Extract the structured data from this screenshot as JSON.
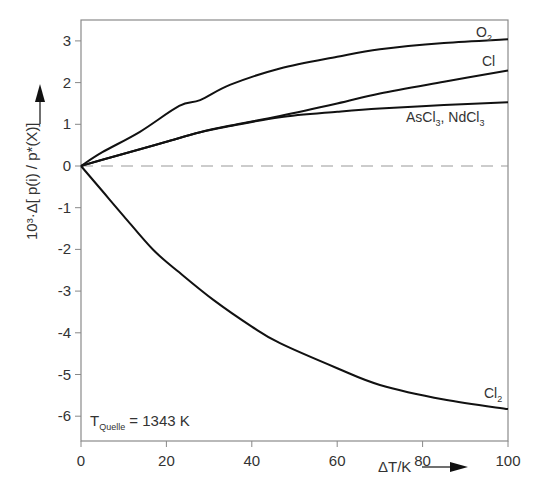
{
  "chart_data": {
    "type": "line",
    "title": "",
    "xlabel": "ΔT/K",
    "ylabel": "10³·Δ[p(i)/p*(X)]",
    "xlim": [
      0,
      100
    ],
    "ylim": [
      -6.6,
      3.5
    ],
    "xticks": [
      0,
      20,
      40,
      60,
      80,
      100
    ],
    "yticks": [
      3,
      2,
      1,
      0,
      -1,
      -2,
      -3,
      -4,
      -5,
      -6
    ],
    "grid": false,
    "reference_line": {
      "y": 0,
      "style": "dashed"
    },
    "annotation": {
      "text": "T",
      "subscript": "Quelle",
      "suffix": " = 1343 K"
    },
    "series": [
      {
        "name": "O2",
        "label_main": "O",
        "label_sub": "2",
        "x": [
          0,
          5,
          13.8,
          23,
          27.9,
          35,
          46.6,
          60,
          70,
          85,
          100
        ],
        "y": [
          0,
          0.33,
          0.82,
          1.44,
          1.58,
          1.95,
          2.34,
          2.62,
          2.8,
          2.95,
          3.04
        ]
      },
      {
        "name": "Cl",
        "label_main": "Cl",
        "label_sub": "",
        "x": [
          0,
          5,
          13.8,
          20,
          27.9,
          35,
          46.6,
          60,
          70,
          85,
          100
        ],
        "y": [
          0,
          0.15,
          0.4,
          0.58,
          0.81,
          0.97,
          1.2,
          1.5,
          1.74,
          2.02,
          2.29
        ]
      },
      {
        "name": "AsCl3, NdCl3",
        "label_main": "AsCl3, NdCl3",
        "label_sub": "",
        "x": [
          0,
          5,
          13.8,
          20,
          27.9,
          35,
          46.6,
          60,
          70,
          85,
          100
        ],
        "y": [
          0,
          0.15,
          0.4,
          0.58,
          0.81,
          0.96,
          1.17,
          1.3,
          1.38,
          1.46,
          1.53
        ]
      },
      {
        "name": "Cl2",
        "label_main": "Cl",
        "label_sub": "2",
        "x": [
          0,
          5,
          10,
          16.9,
          23,
          31,
          40,
          46.6,
          60,
          70,
          85,
          100
        ],
        "y": [
          0,
          -0.6,
          -1.2,
          -2.01,
          -2.55,
          -3.21,
          -3.85,
          -4.25,
          -4.85,
          -5.25,
          -5.6,
          -5.83
        ]
      }
    ]
  },
  "labels": {
    "x_tick": [
      "0",
      "20",
      "40",
      "60",
      "80",
      "100"
    ],
    "y_tick": [
      "3",
      "2",
      "1",
      "0",
      "-1",
      "-2",
      "-3",
      "-4",
      "-5",
      "-6"
    ],
    "xlabel": "ΔT/K",
    "ylabel": "10³·Δ[ p(i) / p*(X)]",
    "o2_main": "O",
    "o2_sub": "2",
    "cl": "Cl",
    "ascl_as": "AsCl",
    "ascl_sub": "3",
    "ascl_sep": ", NdCl",
    "ndcl_sub": "3",
    "cl2_main": "Cl",
    "cl2_sub": "2",
    "tq_main": "T",
    "tq_sub": "Quelle",
    "tq_suffix": " = 1343 K"
  },
  "colors": {
    "curve": "#111111",
    "axis": "#888888",
    "dash": "#999999",
    "text": "#333333"
  }
}
